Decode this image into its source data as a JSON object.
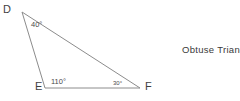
{
  "diagram": {
    "caption": "Obtuse Triangle",
    "background_color": "#ffffff",
    "stroke_color": "#8c8c8c",
    "text_color": "#3a3a3a",
    "vertices": [
      {
        "name": "D",
        "label": "D",
        "x": 22,
        "y": 12
      },
      {
        "name": "E",
        "label": "E",
        "x": 45,
        "y": 88
      },
      {
        "name": "F",
        "label": "F",
        "x": 140,
        "y": 88
      }
    ],
    "sides": [
      {
        "name": "side-de",
        "from": "D",
        "to": "E"
      },
      {
        "name": "side-ef",
        "from": "E",
        "to": "F"
      },
      {
        "name": "side-df",
        "from": "D",
        "to": "F"
      }
    ],
    "angles": [
      {
        "name": "angle-d",
        "at_vertex": "D",
        "label": "40°"
      },
      {
        "name": "angle-e",
        "at_vertex": "E",
        "label": "110°"
      },
      {
        "name": "angle-f",
        "at_vertex": "F",
        "label": "30°"
      }
    ]
  }
}
